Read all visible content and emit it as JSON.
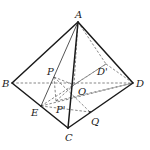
{
  "figure": {
    "points": {
      "A": {
        "label": "A",
        "x": 78,
        "y": 22
      },
      "B": {
        "label": "B",
        "x": 12,
        "y": 83
      },
      "C": {
        "label": "C",
        "x": 68,
        "y": 128
      },
      "D": {
        "label": "D",
        "x": 133,
        "y": 83
      },
      "O": {
        "label": "O",
        "x": 74,
        "y": 85
      },
      "P": {
        "label": "P",
        "x": 57,
        "y": 75
      },
      "E": {
        "label": "E",
        "x": 41,
        "y": 106
      },
      "Pp": {
        "label": "P'",
        "x": 62,
        "y": 100
      },
      "Q": {
        "label": "Q",
        "x": 90,
        "y": 112
      },
      "Dp": {
        "label": "D'",
        "x": 106,
        "y": 64
      }
    },
    "labels": {
      "A": "A",
      "B": "B",
      "C": "C",
      "D": "D",
      "O": "O",
      "P": "P",
      "E": "E",
      "Pp": "P'",
      "Q": "Q",
      "Dp": "D'"
    },
    "colors": {
      "stroke": "#1a1a1a",
      "dashed": "#555555",
      "background": "#ffffff"
    }
  }
}
